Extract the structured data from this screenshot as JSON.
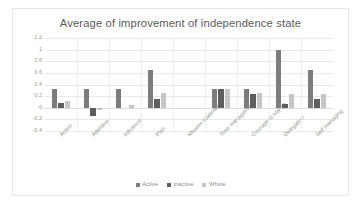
{
  "chart_data": {
    "type": "bar",
    "title": "Average of improvement of independence state",
    "xlabel": "",
    "ylabel": "",
    "ylim": [
      -0.4,
      1.2
    ],
    "yticks": [
      "1.2",
      "1",
      "0.8",
      "0.6",
      "0.4",
      "0.2",
      "0",
      "-0.2",
      "-0.4"
    ],
    "grid": true,
    "legend_position": "bottom",
    "categories": [
      "Action",
      "Attention",
      "Influence",
      "Plan",
      "Mission statement",
      "Time management",
      "Courage to say no",
      "Delegation",
      "Self managing"
    ],
    "series": [
      {
        "name": "Active",
        "color": "#7c7c7c",
        "values": [
          0.32,
          0.32,
          0.32,
          0.65,
          0.0,
          0.32,
          0.32,
          1.0,
          0.65
        ]
      },
      {
        "name": "Inactive",
        "color": "#5e5e5e",
        "values": [
          0.08,
          -0.15,
          0.0,
          0.15,
          0.0,
          0.32,
          0.23,
          0.07,
          0.15
        ]
      },
      {
        "name": "Whole",
        "color": "#c6c6c6",
        "values": [
          0.11,
          -0.04,
          0.05,
          0.25,
          0.0,
          0.32,
          0.25,
          0.24,
          0.24
        ]
      }
    ]
  }
}
